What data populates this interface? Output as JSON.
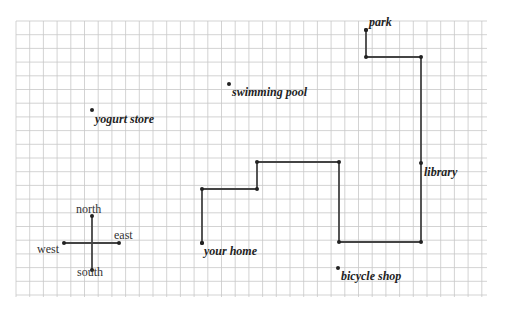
{
  "map": {
    "grid": {
      "x0": 16,
      "y0": 21,
      "x1": 487,
      "y1": 297,
      "spacing": 13.7,
      "line_color": "#c8c8c8"
    },
    "route_color": "#444444",
    "route_points": [
      [
        202,
        243
      ],
      [
        202,
        189
      ],
      [
        257,
        189
      ],
      [
        257,
        162
      ],
      [
        339,
        162
      ],
      [
        339,
        242
      ],
      [
        421,
        242
      ],
      [
        421,
        57
      ],
      [
        366,
        57
      ],
      [
        366,
        30
      ]
    ],
    "places": [
      {
        "label": "park",
        "dot": [
          366,
          30
        ]
      },
      {
        "label": "swimming pool",
        "dot": [
          229,
          84
        ]
      },
      {
        "label": "yogurt store",
        "dot": [
          92,
          110
        ]
      },
      {
        "label": "library",
        "dot": [
          421,
          163
        ]
      },
      {
        "label": "your home",
        "dot": [
          202,
          243
        ]
      },
      {
        "label": "bicycle shop",
        "dot": [
          338,
          268
        ]
      }
    ],
    "compass": {
      "north": "north",
      "south": "south",
      "east": "east",
      "west": "west"
    }
  }
}
